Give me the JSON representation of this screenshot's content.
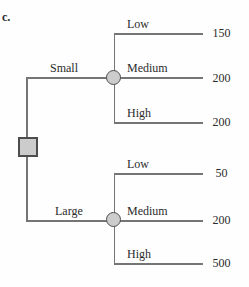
{
  "figure_label": "c.",
  "colors": {
    "line": "#757575",
    "node_fill": "#cccccc",
    "node_border": "#4d4d4d",
    "text": "#2b2b2b",
    "background": "#fefefe"
  },
  "tree": {
    "root_node_type": "decision-square",
    "branches": [
      {
        "label": "Small",
        "node_type": "chance-circle",
        "outcomes": [
          {
            "label": "Low",
            "value": "150"
          },
          {
            "label": "Medium",
            "value": "200"
          },
          {
            "label": "High",
            "value": "200"
          }
        ]
      },
      {
        "label": "Large",
        "node_type": "chance-circle",
        "outcomes": [
          {
            "label": "Low",
            "value": "50"
          },
          {
            "label": "Medium",
            "value": "200"
          },
          {
            "label": "High",
            "value": "500"
          }
        ]
      }
    ]
  }
}
